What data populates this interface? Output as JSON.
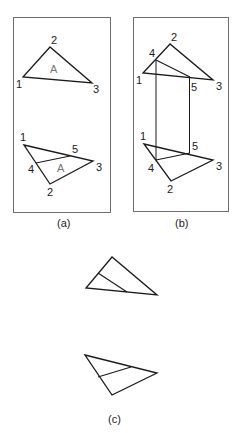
{
  "colors": {
    "line": "#1a1a1a",
    "frame": "#6e6e6e",
    "area_label": "#777777"
  },
  "panels": {
    "a": {
      "caption": "(a)",
      "top_triangle": {
        "v1": "1",
        "v2": "2",
        "v3": "3",
        "area": "A"
      },
      "bottom_triangle": {
        "v1": "1",
        "v2": "2",
        "v3": "3",
        "v4": "4",
        "v5": "5",
        "area": "A"
      }
    },
    "b": {
      "caption": "(b)",
      "top_triangle": {
        "v1": "1",
        "v2": "2",
        "v3": "3",
        "v4": "4",
        "v5": "5"
      },
      "bottom_triangle": {
        "v1": "1",
        "v2": "2",
        "v3": "3",
        "v4": "4",
        "v5": "5"
      }
    },
    "c": {
      "caption": "(c)"
    }
  }
}
